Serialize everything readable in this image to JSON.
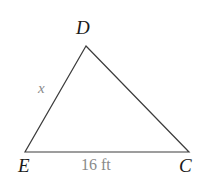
{
  "figure": {
    "type": "triangle-diagram",
    "background_color": "#ffffff",
    "stroke_color": "#3c3c3c",
    "vertex_label_color": "#1a1a1a",
    "annotation_color": "#8a8a8a",
    "vertices": [
      {
        "name": "D",
        "label": "D",
        "x": 86,
        "y": 46
      },
      {
        "name": "E",
        "label": "E",
        "x": 25,
        "y": 152
      },
      {
        "name": "C",
        "label": "C",
        "x": 189,
        "y": 152
      }
    ],
    "labels": {
      "apex": "D",
      "bottom_left": "E",
      "bottom_right": "C"
    },
    "side_labels": {
      "left_side": "x",
      "base": "16 ft"
    },
    "measurements": {
      "base_value": "16",
      "base_unit": "ft",
      "unknown_side": "x"
    }
  }
}
